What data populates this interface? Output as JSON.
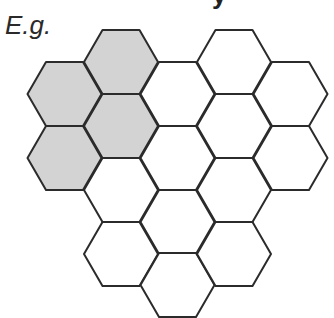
{
  "diagram": {
    "title_fragment": "y",
    "example_label": "E.g.",
    "colors": {
      "shaded": "#d3d3d3",
      "empty": "#ffffff",
      "stroke": "#2b2b2b"
    },
    "hex": {
      "radius": 37,
      "half_height": 32
    },
    "cells": [
      {
        "col": 0,
        "cx": 64.5,
        "cy": 94,
        "shaded": true
      },
      {
        "col": 0,
        "cx": 64.5,
        "cy": 158,
        "shaded": true
      },
      {
        "col": 1,
        "cx": 121,
        "cy": 62,
        "shaded": true
      },
      {
        "col": 1,
        "cx": 121,
        "cy": 126,
        "shaded": true
      },
      {
        "col": 1,
        "cx": 121,
        "cy": 190,
        "shaded": false
      },
      {
        "col": 1,
        "cx": 121,
        "cy": 254,
        "shaded": false
      },
      {
        "col": 2,
        "cx": 177.5,
        "cy": 94,
        "shaded": false
      },
      {
        "col": 2,
        "cx": 177.5,
        "cy": 158,
        "shaded": false
      },
      {
        "col": 2,
        "cx": 177.5,
        "cy": 222,
        "shaded": false
      },
      {
        "col": 2,
        "cx": 177.5,
        "cy": 285,
        "shaded": false
      },
      {
        "col": 3,
        "cx": 234,
        "cy": 62,
        "shaded": false
      },
      {
        "col": 3,
        "cx": 234,
        "cy": 126,
        "shaded": false
      },
      {
        "col": 3,
        "cx": 234,
        "cy": 190,
        "shaded": false
      },
      {
        "col": 3,
        "cx": 234,
        "cy": 254,
        "shaded": false
      },
      {
        "col": 4,
        "cx": 290.5,
        "cy": 94,
        "shaded": false
      },
      {
        "col": 4,
        "cx": 290.5,
        "cy": 158,
        "shaded": false
      }
    ],
    "shaded_count": 4,
    "total_count": 16
  }
}
